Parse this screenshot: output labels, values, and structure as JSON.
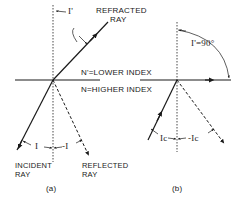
{
  "diagram": {
    "panel_a": {
      "caption": "(a)",
      "labels": {
        "refracted_ray_line1": "REFRACTED",
        "refracted_ray_line2": "RAY",
        "refraction_angle": "I'",
        "lower_index": "N'=LOWER INDEX",
        "higher_index": "N=HIGHER INDEX",
        "incident_angle": "I",
        "reflected_angle": "-I",
        "incident_ray_line1": "INCIDENT",
        "incident_ray_line2": "RAY",
        "reflected_ray_line1": "REFLECTED",
        "reflected_ray_line2": "RAY"
      }
    },
    "panel_b": {
      "caption": "(b)",
      "labels": {
        "refraction_angle": "I'=90°",
        "critical_angle": "Ic",
        "reflected_critical_angle": "-Ic"
      }
    },
    "colors": {
      "ink": "#1a1a1a",
      "background": "#ffffff"
    }
  }
}
